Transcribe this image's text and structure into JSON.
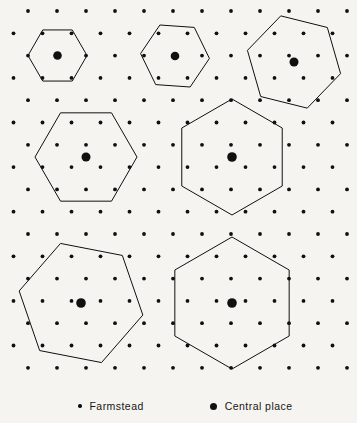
{
  "figure": {
    "background_color": "#f5f4f0",
    "ink_color": "#101010",
    "width": 357,
    "height": 423
  },
  "lattice": {
    "description": "triangular lattice of farmstead dots",
    "row_spacing": 22.3,
    "column_spacing": 29.0,
    "origin_x": 28,
    "origin_y": 11,
    "columns": 12,
    "rows": 17,
    "dot_radius": 1.9,
    "dot_color": "#101010"
  },
  "hexagons": [
    {
      "name": "hexagon-top-left",
      "order": "k=3 small market area",
      "cx": 57.5,
      "cy": 55.5,
      "radius": 29.5,
      "rotation_deg": 0,
      "stroke_width": 1.0
    },
    {
      "name": "hexagon-top-center",
      "order": "k=3 market area",
      "cx": 175.0,
      "cy": 56.0,
      "radius": 34.5,
      "rotation_deg": 4,
      "stroke_width": 1.0
    },
    {
      "name": "hexagon-top-right",
      "order": "k=7 market area",
      "cx": 294.0,
      "cy": 62.0,
      "radius": 48.0,
      "rotation_deg": 14,
      "stroke_width": 1.0
    },
    {
      "name": "hexagon-middle-left",
      "order": "k=7 market area",
      "cx": 86.0,
      "cy": 157.0,
      "radius": 51.0,
      "rotation_deg": 0,
      "stroke_width": 1.0
    },
    {
      "name": "hexagon-middle-right",
      "order": "k=12 market area",
      "cx": 232.0,
      "cy": 157.0,
      "radius": 58.0,
      "rotation_deg": 30,
      "stroke_width": 1.0
    },
    {
      "name": "hexagon-bottom-left",
      "order": "k=13 market area",
      "cx": 81.0,
      "cy": 303.0,
      "radius": 63.0,
      "rotation_deg": 11,
      "stroke_width": 1.0
    },
    {
      "name": "hexagon-bottom-right",
      "order": "k=13 market area",
      "cx": 232.0,
      "cy": 303.0,
      "radius": 66.0,
      "rotation_deg": 30,
      "stroke_width": 1.0
    }
  ],
  "central_places": [
    {
      "name": "central-place-top-left",
      "cx": 57.5,
      "cy": 55.5,
      "r": 4.3
    },
    {
      "name": "central-place-top-center",
      "cx": 175.0,
      "cy": 56.0,
      "r": 4.3
    },
    {
      "name": "central-place-top-right",
      "cx": 294.0,
      "cy": 62.0,
      "r": 4.5
    },
    {
      "name": "central-place-middle-left",
      "cx": 86.0,
      "cy": 157.0,
      "r": 4.5
    },
    {
      "name": "central-place-middle-right",
      "cx": 232.0,
      "cy": 157.0,
      "r": 4.8
    },
    {
      "name": "central-place-bottom-left",
      "cx": 81.0,
      "cy": 303.0,
      "r": 4.8
    },
    {
      "name": "central-place-bottom-right",
      "cx": 232.0,
      "cy": 303.0,
      "r": 4.8
    }
  ],
  "legend": {
    "items": [
      {
        "symbol": "small-dot",
        "label": "Farmstead"
      },
      {
        "symbol": "large-dot",
        "label": "Central place"
      }
    ]
  }
}
